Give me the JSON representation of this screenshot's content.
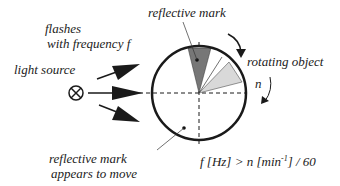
{
  "labels": {
    "reflective_mark_top": "reflective mark",
    "flashes_line1": "flashes",
    "flashes_line2": "with frequency f",
    "light_source": "light source",
    "rotating_object": "rotating object",
    "speed_symbol": "n",
    "reflective_mark_bottom_line1": "reflective mark",
    "reflective_mark_bottom_line2": "appears to move"
  },
  "formula": {
    "lhs": "f [Hz] > n [min",
    "exponent": "-1",
    "rhs": "] / 60"
  },
  "colors": {
    "stroke": "#1a1a1a",
    "mark_dark": "#777777",
    "mark_light": "#d9d9d9",
    "text": "#222222"
  }
}
